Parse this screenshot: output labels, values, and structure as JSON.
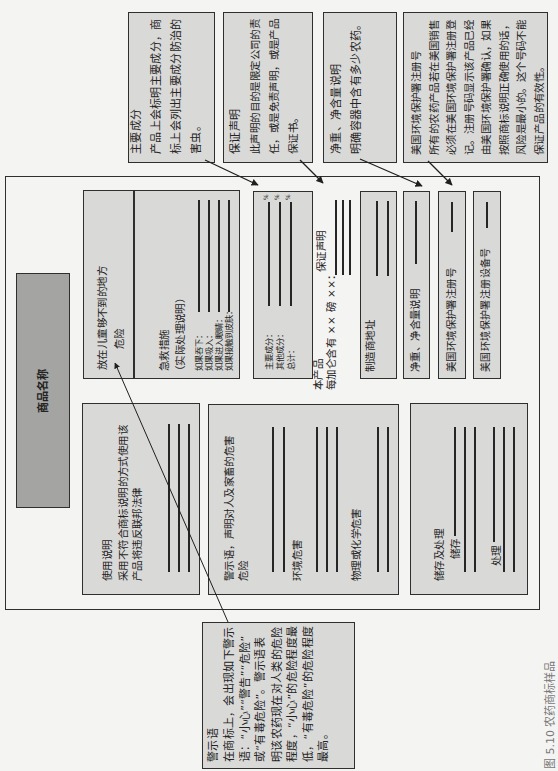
{
  "figure": {
    "caption": "图 5.10  农药商标样品"
  },
  "callouts": {
    "active_ingredients": {
      "title": "主要成分",
      "lines": [
        "产品上会标明主要成分，商",
        "标上会列出主要成分防治的",
        "害虫。"
      ]
    },
    "warranty": {
      "title": "保证声明",
      "lines": [
        "此声明的目的是限定公司的责",
        "任，或是免责声明，或是产品",
        "保证书。"
      ]
    },
    "net_contents": {
      "title": "净重、净含量说明",
      "lines": [
        "明确容器中含有多少农药。"
      ]
    },
    "epa_registration": {
      "title": "美国环境保护署注册号",
      "lines": [
        "所有的农药产品若在美国销售",
        "必须在美国环境保护署注册登",
        "记。注册号码显示该产品已经",
        "由美国环境保护署确认，如果",
        "按照商标说明正确使用的话，",
        "风险是最小的。这个号码不能",
        "保证产品的有效性。"
      ]
    },
    "signal_word": {
      "title": "警示语",
      "lines": [
        "在商标上，会出现如下警示",
        "语：“小心”“警告”“危险”",
        "或“有毒危险”。警示语表",
        "明该农药现在对人类的危险",
        "程度，“小心”的危险程度最",
        "低，“有毒危险”的危险程度",
        "最高。"
      ]
    }
  },
  "label": {
    "product_name": "商品名称",
    "keep_out": {
      "text": "放在儿童够不到的地方",
      "signal": "危险"
    },
    "first_aid": {
      "title": "急救措施",
      "subtitle": "（实际处理说明）",
      "items": [
        "如果吞下：",
        "如果吸入：",
        "如果进入眼睛：",
        "如果接触到皮肤："
      ]
    },
    "ingredients": {
      "items": [
        "主要成分：",
        "其他成分：",
        "总计："
      ],
      "unit": "%"
    },
    "product_statement": {
      "line1": "本产品",
      "line2": "每加仑含有 ×× 磅 ××：",
      "warranty_label": "保证声明"
    },
    "manufacturer": "制造商地址",
    "net_contents": "净重、净含量说明",
    "epa_reg_no": "美国环境保护署注册号",
    "epa_est_no": "美国环境保护署注册设备号",
    "directions": {
      "title": "使用说明",
      "lines": [
        "采用不符合商标说明的方式使用该",
        "产品将违反联邦法律"
      ]
    },
    "precautionary": {
      "title": "警示语，声明对人及家畜的危害",
      "signal": "危险",
      "environmental": "环境危害",
      "physical_chemical": "物理或化学危害"
    },
    "storage_disposal": {
      "title": "储存及处理",
      "storage": "储存",
      "disposal": "处理"
    }
  },
  "colors": {
    "background": "#f4f4f2",
    "box_fill": "#d9d9d7",
    "product_name_fill": "#a4a4a2",
    "border": "#2f2f2f",
    "caption": "#777777"
  }
}
